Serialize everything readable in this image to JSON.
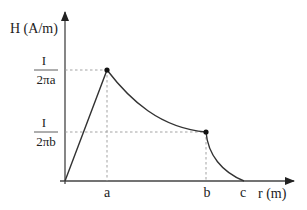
{
  "diagram": {
    "type": "piecewise magnetic field plot",
    "y_axis_label": "H (A/m)",
    "x_axis_label": "r (m)",
    "y_ticks": [
      {
        "numerator": "I",
        "denominator": "2πa"
      },
      {
        "numerator": "I",
        "denominator": "2πb"
      }
    ],
    "x_ticks": [
      "a",
      "b",
      "c"
    ],
    "colors": {
      "axis": "#333333",
      "curve": "#333333",
      "guide": "#888888"
    }
  }
}
